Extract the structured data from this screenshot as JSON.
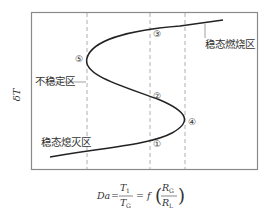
{
  "diagram": {
    "y_axis_label": "δT",
    "regions": {
      "steady_burning": "稳态燃烧区",
      "unstable": "不稳定区",
      "steady_extinction": "稳态熄灭区"
    },
    "points": [
      "①",
      "②",
      "③",
      "④",
      "⑤"
    ],
    "formula": {
      "lhs": "Da",
      "eq": "=",
      "num": "T",
      "num_sub": "1",
      "den": "T",
      "den_sub": "G",
      "eq2": "= f",
      "arg_num": "R",
      "arg_num_sub": "G",
      "arg_den": "R",
      "arg_den_sub": "L"
    },
    "colors": {
      "curve": "#222222",
      "frame": "#888888",
      "dashed": "#999999",
      "text": "#333333"
    }
  }
}
